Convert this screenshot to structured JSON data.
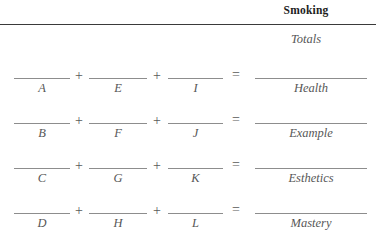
{
  "header": {
    "column_title": "Smoking",
    "totals_label": "Totals"
  },
  "operators": {
    "plus": "+",
    "equals": "="
  },
  "form": {
    "rows": [
      {
        "term1": "A",
        "term2": "E",
        "term3": "I",
        "total": "Health"
      },
      {
        "term1": "B",
        "term2": "F",
        "term3": "J",
        "total": "Example"
      },
      {
        "term1": "C",
        "term2": "G",
        "term3": "K",
        "total": "Esthetics"
      },
      {
        "term1": "D",
        "term2": "H",
        "term3": "L",
        "total": "Mastery"
      }
    ]
  }
}
